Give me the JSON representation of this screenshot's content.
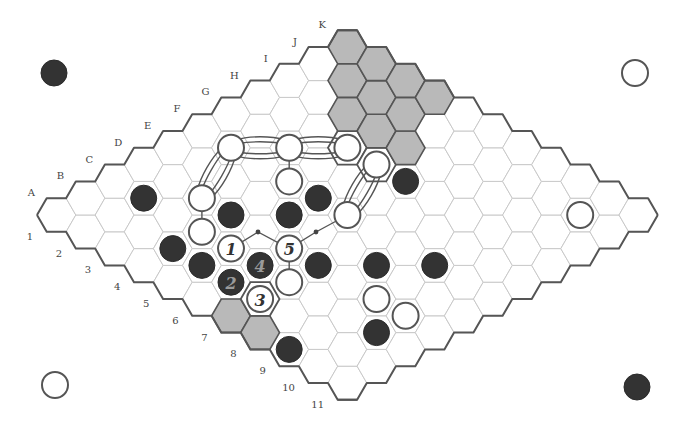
{
  "board": {
    "size": 11,
    "columns": [
      "A",
      "B",
      "C",
      "D",
      "E",
      "F",
      "G",
      "H",
      "I",
      "J",
      "K"
    ],
    "rows": [
      "1",
      "2",
      "3",
      "4",
      "5",
      "6",
      "7",
      "8",
      "9",
      "10",
      "11"
    ],
    "geometry": {
      "origin_x": 56.4,
      "origin_y": 215,
      "hex_radius": 19.4
    },
    "colors": {
      "black_stone": "#333333",
      "white_stone": "#ffffff",
      "shaded_cell": "#b9b9b9",
      "edge": "#555555",
      "grid": "#c9c9c9"
    }
  },
  "corner_stones": [
    {
      "position": "top-left",
      "color": "black",
      "x": 54,
      "y": 73
    },
    {
      "position": "top-right",
      "color": "white",
      "x": 635,
      "y": 73
    },
    {
      "position": "bottom-left",
      "color": "white",
      "x": 55,
      "y": 385
    },
    {
      "position": "bottom-right",
      "color": "black",
      "x": 637,
      "y": 387
    }
  ],
  "shaded_cells": [
    "K1",
    "K2",
    "K3",
    "K4",
    "J2",
    "J3",
    "J4",
    "I3",
    "I4",
    "I5",
    "A7",
    "A8"
  ],
  "outlined_cells": [
    "H4",
    "H5",
    "B7"
  ],
  "stones": [
    {
      "cell": "F2",
      "color": "white",
      "label": ""
    },
    {
      "cell": "G3",
      "color": "white",
      "label": ""
    },
    {
      "cell": "H4",
      "color": "white",
      "label": ""
    },
    {
      "cell": "H5",
      "color": "white",
      "label": ""
    },
    {
      "cell": "F4",
      "color": "white",
      "label": ""
    },
    {
      "cell": "D3",
      "color": "white",
      "label": ""
    },
    {
      "cell": "C4",
      "color": "white",
      "label": ""
    },
    {
      "cell": "F6",
      "color": "white",
      "label": ""
    },
    {
      "cell": "C5",
      "color": "white",
      "label": "1"
    },
    {
      "cell": "D6",
      "color": "white",
      "label": "5"
    },
    {
      "cell": "C7",
      "color": "white",
      "label": ""
    },
    {
      "cell": "B7",
      "color": "white",
      "label": "3"
    },
    {
      "cell": "D9",
      "color": "white",
      "label": ""
    },
    {
      "cell": "D10",
      "color": "white",
      "label": ""
    },
    {
      "cell": "J10",
      "color": "white",
      "label": ""
    },
    {
      "cell": "C2",
      "color": "black",
      "label": ""
    },
    {
      "cell": "H6",
      "color": "black",
      "label": ""
    },
    {
      "cell": "F5",
      "color": "black",
      "label": ""
    },
    {
      "cell": "D4",
      "color": "black",
      "label": ""
    },
    {
      "cell": "E5",
      "color": "black",
      "label": ""
    },
    {
      "cell": "B4",
      "color": "black",
      "label": ""
    },
    {
      "cell": "B5",
      "color": "black",
      "label": ""
    },
    {
      "cell": "C6",
      "color": "black",
      "label": "4"
    },
    {
      "cell": "B6",
      "color": "black",
      "label": "2"
    },
    {
      "cell": "D7",
      "color": "black",
      "label": ""
    },
    {
      "cell": "E8",
      "color": "black",
      "label": ""
    },
    {
      "cell": "F9",
      "color": "black",
      "label": ""
    },
    {
      "cell": "C10",
      "color": "black",
      "label": ""
    },
    {
      "cell": "A9",
      "color": "black",
      "label": ""
    }
  ],
  "bridges": [
    {
      "from": "F2",
      "to": "G3"
    },
    {
      "from": "G3",
      "to": "H4"
    },
    {
      "from": "F2",
      "to": "D3"
    },
    {
      "from": "H5",
      "to": "F6"
    }
  ],
  "lines": [
    {
      "from": "G3",
      "to": "F4"
    },
    {
      "from": "D3",
      "to": "C4"
    },
    {
      "from": "D6",
      "to": "C7"
    }
  ],
  "dotted_links": [
    {
      "from": "C5",
      "via": [
        258,
        232
      ],
      "to": "D6"
    },
    {
      "from": "D6",
      "via": [
        316,
        232
      ],
      "to": "F6"
    }
  ]
}
